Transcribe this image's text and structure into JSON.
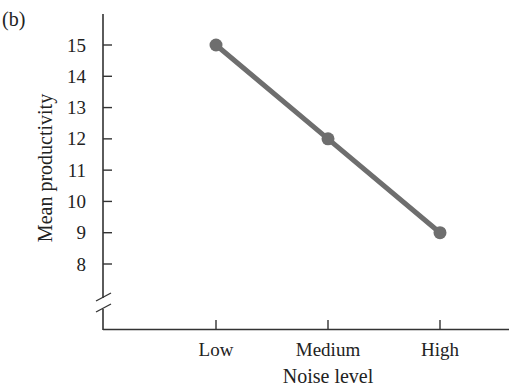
{
  "page": {
    "panel_label": "(b)",
    "clipped_caption_fragment": "?, respectively"
  },
  "chart_data": {
    "type": "line",
    "title": "",
    "panel": "(b)",
    "xlabel": "Noise level",
    "ylabel": "Mean productivity",
    "categories": [
      "Low",
      "Medium",
      "High"
    ],
    "series": [
      {
        "name": "Mean productivity",
        "values": [
          15,
          12,
          9
        ],
        "color": "#6e6e6e",
        "marker": "circle"
      }
    ],
    "yticks": [
      8,
      9,
      10,
      11,
      12,
      13,
      14,
      15
    ],
    "ytick_labels": [
      "8",
      "9",
      "10",
      "11",
      "12",
      "13",
      "14",
      "15"
    ],
    "ylim": [
      7,
      16
    ],
    "y_axis_break": true,
    "grid": false,
    "legend": "none"
  }
}
